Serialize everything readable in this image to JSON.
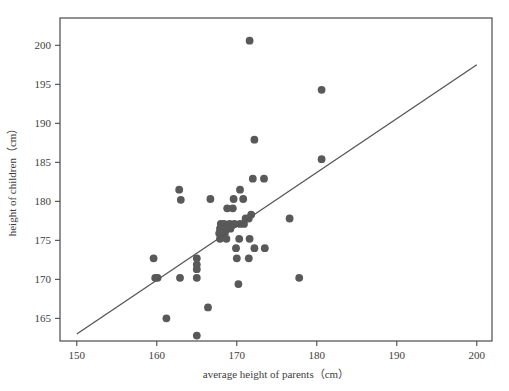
{
  "chart_data": {
    "type": "scatter",
    "title": "",
    "xlabel": "average height of parents（cm）",
    "ylabel": "height of children（cm）",
    "xlim": [
      147.9,
      201.9
    ],
    "ylim": [
      162.1,
      203.5
    ],
    "xticks": [
      150,
      160,
      170,
      180,
      190,
      200
    ],
    "yticks": [
      165,
      170,
      175,
      180,
      185,
      190,
      195,
      200
    ],
    "xtick_labels": [
      "150",
      "160",
      "170",
      "180",
      "190",
      "200"
    ],
    "ytick_labels": [
      "165",
      "170",
      "175",
      "180",
      "185",
      "190",
      "195",
      "200"
    ],
    "grid": false,
    "legend": null,
    "marker_color": "#595959",
    "marker_size": 5.4,
    "line_color": "#555555",
    "frame_color": "#4a4a4a",
    "series": [
      {
        "name": "children vs parents height",
        "type": "scatter",
        "points": [
          [
            171.6,
            200.6
          ],
          [
            180.6,
            194.3
          ],
          [
            172.2,
            187.9
          ],
          [
            180.6,
            185.4
          ],
          [
            172.0,
            182.9
          ],
          [
            173.4,
            182.9
          ],
          [
            162.8,
            181.5
          ],
          [
            170.4,
            181.5
          ],
          [
            163.0,
            180.2
          ],
          [
            166.7,
            180.3
          ],
          [
            169.6,
            180.3
          ],
          [
            170.8,
            180.3
          ],
          [
            168.8,
            179.1
          ],
          [
            169.5,
            179.1
          ],
          [
            171.8,
            178.3
          ],
          [
            171.1,
            177.8
          ],
          [
            171.5,
            177.8
          ],
          [
            176.6,
            177.8
          ],
          [
            168.0,
            177.1
          ],
          [
            168.4,
            177.1
          ],
          [
            169.1,
            177.1
          ],
          [
            169.7,
            177.1
          ],
          [
            170.4,
            177.1
          ],
          [
            170.9,
            177.1
          ],
          [
            167.9,
            176.5
          ],
          [
            168.6,
            176.5
          ],
          [
            169.2,
            176.5
          ],
          [
            167.8,
            175.9
          ],
          [
            168.5,
            175.9
          ],
          [
            167.9,
            175.2
          ],
          [
            168.7,
            175.2
          ],
          [
            170.3,
            175.2
          ],
          [
            171.6,
            175.2
          ],
          [
            169.9,
            174.0
          ],
          [
            172.2,
            174.0
          ],
          [
            173.5,
            174.0
          ],
          [
            159.6,
            172.7
          ],
          [
            165.0,
            172.7
          ],
          [
            170.0,
            172.7
          ],
          [
            171.5,
            172.7
          ],
          [
            165.0,
            171.9
          ],
          [
            165.0,
            171.3
          ],
          [
            159.8,
            170.2
          ],
          [
            160.1,
            170.2
          ],
          [
            162.9,
            170.2
          ],
          [
            165.0,
            170.2
          ],
          [
            177.8,
            170.2
          ],
          [
            170.2,
            169.4
          ],
          [
            166.4,
            166.4
          ],
          [
            161.2,
            165.0
          ],
          [
            165.0,
            162.8
          ]
        ]
      },
      {
        "name": "regression line",
        "type": "line",
        "x": [
          150,
          200
        ],
        "y": [
          163.0,
          197.5
        ]
      }
    ]
  }
}
